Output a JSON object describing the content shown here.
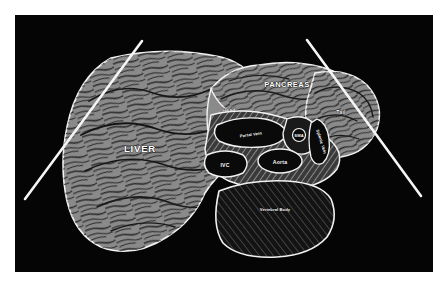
{
  "figure": {
    "panel_background": "#050505",
    "page_background": "#ffffff"
  },
  "palette": {
    "organ_gray": "#8a8a8a",
    "organ_gray_light": "#9a9a9a",
    "outline_white": "#f2f2f2",
    "vessel_dark": "#0a0a0a",
    "bone_dark": "#131313",
    "label_white": "#ffffff",
    "marker_line": "#f5f5f5"
  },
  "labels": {
    "liver": "LIVER",
    "pancreas": "PANCREAS",
    "head": "Head",
    "tail": "Tail",
    "portal_vein": "Portal Vein",
    "splenic_vein": "Splenic Vein",
    "sma": "SMA",
    "aorta": "Aorta",
    "ivc": "IVC",
    "vertebral_body": "Vertebral Body"
  },
  "structures": [
    {
      "id": "liver",
      "label": "LIVER",
      "kind": "organ",
      "fill": "#8a8a8a"
    },
    {
      "id": "pancreas",
      "label": "PANCREAS",
      "kind": "organ",
      "fill": "#8a8a8a"
    },
    {
      "id": "pancreas-head",
      "label": "Head",
      "kind": "region",
      "fill": "#8a8a8a"
    },
    {
      "id": "pancreas-tail",
      "label": "Tail",
      "kind": "region",
      "fill": "#8a8a8a"
    },
    {
      "id": "portal-vein",
      "label": "Portal Vein",
      "kind": "vessel",
      "fill": "#0a0a0a"
    },
    {
      "id": "splenic-vein",
      "label": "Splenic Vein",
      "kind": "vessel",
      "fill": "#0a0a0a"
    },
    {
      "id": "sma",
      "label": "SMA",
      "kind": "vessel",
      "fill": "#0a0a0a"
    },
    {
      "id": "aorta",
      "label": "Aorta",
      "kind": "vessel",
      "fill": "#0a0a0a"
    },
    {
      "id": "ivc",
      "label": "IVC",
      "kind": "vessel",
      "fill": "#0a0a0a"
    },
    {
      "id": "vertebral-body",
      "label": "Vertebral Body",
      "kind": "bone",
      "fill": "#131313"
    }
  ],
  "markers": {
    "left_line": "scan-plane-marker-left",
    "right_line": "scan-plane-marker-right"
  }
}
